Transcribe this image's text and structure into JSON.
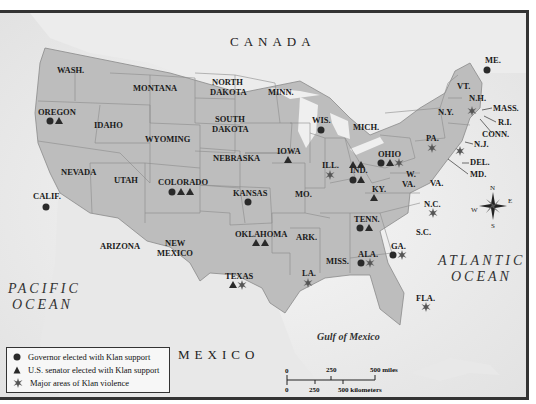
{
  "map": {
    "countries": {
      "canada": "CANADA",
      "mexico": "MEXICO"
    },
    "oceans": {
      "pacific_line1": "PACIFIC",
      "pacific_line2": "OCEAN",
      "atlantic_line1": "ATLANTIC",
      "atlantic_line2": "OCEAN",
      "gulf": "Gulf of Mexico"
    },
    "states": [
      {
        "abbr": "WASH.",
        "gov": 0,
        "sen": 0,
        "vio": 0
      },
      {
        "abbr": "OREGON",
        "gov": 1,
        "sen": 1,
        "vio": 0
      },
      {
        "abbr": "CALIF.",
        "gov": 1,
        "sen": 0,
        "vio": 0
      },
      {
        "abbr": "IDAHO",
        "gov": 0,
        "sen": 0,
        "vio": 0
      },
      {
        "abbr": "NEVADA",
        "gov": 0,
        "sen": 0,
        "vio": 0
      },
      {
        "abbr": "MONTANA",
        "gov": 0,
        "sen": 0,
        "vio": 0
      },
      {
        "abbr": "WYOMING",
        "gov": 0,
        "sen": 0,
        "vio": 0
      },
      {
        "abbr": "UTAH",
        "gov": 0,
        "sen": 0,
        "vio": 0
      },
      {
        "abbr": "ARIZONA",
        "gov": 0,
        "sen": 0,
        "vio": 0
      },
      {
        "abbr": "COLORADO",
        "gov": 1,
        "sen": 2,
        "vio": 0
      },
      {
        "abbr": "NEW MEXICO",
        "gov": 0,
        "sen": 0,
        "vio": 0
      },
      {
        "abbr": "NORTH DAKOTA",
        "gov": 0,
        "sen": 0,
        "vio": 0
      },
      {
        "abbr": "SOUTH DAKOTA",
        "gov": 0,
        "sen": 0,
        "vio": 0
      },
      {
        "abbr": "NEBRASKA",
        "gov": 0,
        "sen": 0,
        "vio": 0
      },
      {
        "abbr": "KANSAS",
        "gov": 1,
        "sen": 0,
        "vio": 0
      },
      {
        "abbr": "OKLAHOMA",
        "gov": 0,
        "sen": 2,
        "vio": 0
      },
      {
        "abbr": "TEXAS",
        "gov": 0,
        "sen": 1,
        "vio": 1
      },
      {
        "abbr": "MINN.",
        "gov": 0,
        "sen": 0,
        "vio": 0
      },
      {
        "abbr": "IOWA",
        "gov": 0,
        "sen": 1,
        "vio": 0
      },
      {
        "abbr": "MO.",
        "gov": 0,
        "sen": 0,
        "vio": 0
      },
      {
        "abbr": "ARK.",
        "gov": 0,
        "sen": 0,
        "vio": 0
      },
      {
        "abbr": "LA.",
        "gov": 0,
        "sen": 0,
        "vio": 1
      },
      {
        "abbr": "WIS.",
        "gov": 1,
        "sen": 0,
        "vio": 0
      },
      {
        "abbr": "ILL.",
        "gov": 0,
        "sen": 0,
        "vio": 1
      },
      {
        "abbr": "MICH.",
        "gov": 0,
        "sen": 0,
        "vio": 0
      },
      {
        "abbr": "IND.",
        "gov": 1,
        "sen": 3,
        "vio": 0
      },
      {
        "abbr": "OHIO",
        "gov": 1,
        "sen": 1,
        "vio": 1
      },
      {
        "abbr": "KY.",
        "gov": 0,
        "sen": 1,
        "vio": 0
      },
      {
        "abbr": "TENN.",
        "gov": 1,
        "sen": 1,
        "vio": 0
      },
      {
        "abbr": "MISS.",
        "gov": 0,
        "sen": 0,
        "vio": 0
      },
      {
        "abbr": "ALA.",
        "gov": 1,
        "sen": 0,
        "vio": 1
      },
      {
        "abbr": "GA.",
        "gov": 1,
        "sen": 0,
        "vio": 1
      },
      {
        "abbr": "FLA.",
        "gov": 0,
        "sen": 0,
        "vio": 1
      },
      {
        "abbr": "S.C.",
        "gov": 0,
        "sen": 0,
        "vio": 0
      },
      {
        "abbr": "N.C.",
        "gov": 0,
        "sen": 0,
        "vio": 1
      },
      {
        "abbr": "VA.",
        "gov": 0,
        "sen": 0,
        "vio": 0
      },
      {
        "abbr": "W. VA.",
        "gov": 0,
        "sen": 0,
        "vio": 0
      },
      {
        "abbr": "PA.",
        "gov": 0,
        "sen": 0,
        "vio": 1
      },
      {
        "abbr": "N.Y.",
        "gov": 0,
        "sen": 0,
        "vio": 0
      },
      {
        "abbr": "N.J.",
        "gov": 0,
        "sen": 0,
        "vio": 1
      },
      {
        "abbr": "DEL.",
        "gov": 0,
        "sen": 0,
        "vio": 0
      },
      {
        "abbr": "MD.",
        "gov": 0,
        "sen": 0,
        "vio": 0
      },
      {
        "abbr": "VT.",
        "gov": 0,
        "sen": 0,
        "vio": 0
      },
      {
        "abbr": "N.H.",
        "gov": 0,
        "sen": 0,
        "vio": 0
      },
      {
        "abbr": "MASS.",
        "gov": 0,
        "sen": 0,
        "vio": 1
      },
      {
        "abbr": "R.I.",
        "gov": 0,
        "sen": 0,
        "vio": 0
      },
      {
        "abbr": "CONN.",
        "gov": 0,
        "sen": 0,
        "vio": 0
      },
      {
        "abbr": "ME.",
        "gov": 1,
        "sen": 0,
        "vio": 0
      }
    ],
    "labels": {
      "wash": "WASH.",
      "oregon": "OREGON",
      "calif": "CALIF.",
      "idaho": "IDAHO",
      "nevada": "NEVADA",
      "montana": "MONTANA",
      "wyoming": "WYOMING",
      "utah": "UTAH",
      "arizona": "ARIZONA",
      "colorado": "COLORADO",
      "newmexico1": "NEW",
      "newmexico2": "MEXICO",
      "nd1": "NORTH",
      "nd2": "DAKOTA",
      "sd1": "SOUTH",
      "sd2": "DAKOTA",
      "nebraska": "NEBRASKA",
      "kansas": "KANSAS",
      "oklahoma": "OKLAHOMA",
      "texas": "TEXAS",
      "minn": "MINN.",
      "iowa": "IOWA",
      "mo": "MO.",
      "ark": "ARK.",
      "la": "LA.",
      "wis": "WIS.",
      "ill": "ILL.",
      "mich": "MICH.",
      "ind": "IND.",
      "ohio": "OHIO",
      "ky": "KY.",
      "tenn": "TENN.",
      "miss": "MISS.",
      "ala": "ALA.",
      "ga": "GA.",
      "fla": "FLA.",
      "sc": "S.C.",
      "nc": "N.C.",
      "va": "VA.",
      "wva1": "W.",
      "wva2": "VA.",
      "pa": "PA.",
      "ny": "N.Y.",
      "nj": "N.J.",
      "del": "DEL.",
      "md": "MD.",
      "vt": "VT.",
      "nh": "N.H.",
      "mass": "MASS.",
      "ri": "R.I.",
      "conn": "CONN.",
      "me": "ME."
    },
    "compass": {
      "n": "N",
      "s": "S",
      "e": "E",
      "w": "W"
    },
    "scale": {
      "m0": "0",
      "m250": "250",
      "m500": "500 miles",
      "k0": "0",
      "k250": "250",
      "k500": "500 kilometers"
    }
  },
  "legend": {
    "items": [
      {
        "symbol": "circle",
        "label": "Governor elected with Klan support"
      },
      {
        "symbol": "triangle",
        "label": "U.S. senator elected with Klan support"
      },
      {
        "symbol": "starburst",
        "label": "Major areas of Klan violence"
      }
    ]
  },
  "colors": {
    "land": "#bdbdbd",
    "ocean": "#f2f2f2",
    "foreign": "#e6e6e6",
    "symbol": "#2a2a2a",
    "violence": "#6a6a6a"
  }
}
